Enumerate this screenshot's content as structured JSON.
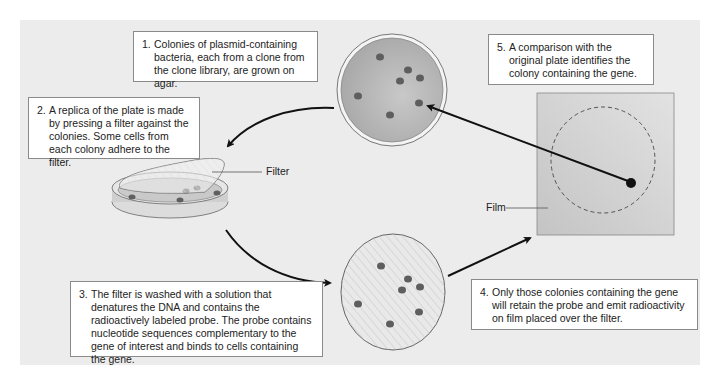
{
  "steps": [
    {
      "num": "1.",
      "text": "Colonies of plasmid-containing bacteria, each from a clone from the clone library, are grown on agar."
    },
    {
      "num": "2.",
      "text": "A replica of the plate is made by pressing a filter against the colonies. Some cells from each colony adhere to the filter."
    },
    {
      "num": "3.",
      "text": "The filter is washed with a solution that denatures the DNA and contains the radioactively labeled probe. The probe contains nucleotide sequences complementary to the gene of interest and binds to cells containing the gene."
    },
    {
      "num": "4.",
      "text": "Only those colonies containing the gene will retain the probe and emit radioactivity on film placed over the filter."
    },
    {
      "num": "5.",
      "text": "A comparison with the original plate identifies the colony containing the gene."
    }
  ],
  "labels": {
    "filter": "Filter",
    "film": "Film"
  },
  "colors": {
    "background": "#ececec",
    "plate_fill": "#b9b9b9",
    "colony": "#5e5e5e",
    "film": "#d2d2d2",
    "arrow": "#111111"
  }
}
